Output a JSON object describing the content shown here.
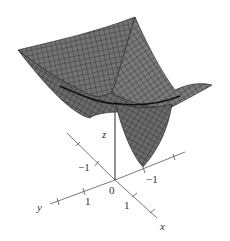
{
  "figure": {
    "type": "3d-surface-plot",
    "surface_color": "#6b6b6b",
    "mesh_color": "#2a2a2a",
    "axis_color": "#555555"
  },
  "axes": {
    "x": {
      "label": "x",
      "ticks": [
        "-1",
        "1"
      ]
    },
    "y": {
      "label": "y",
      "ticks": [
        "-1",
        "1"
      ]
    },
    "z": {
      "label": "z"
    },
    "origin_label": "0"
  },
  "labels": {
    "z_axis": "z",
    "y_axis": "y",
    "x_axis": "x",
    "origin": "0",
    "y_neg_tick": "−1",
    "y_pos_tick": "1",
    "x_neg_tick": "−1",
    "x_pos_tick": "1"
  }
}
